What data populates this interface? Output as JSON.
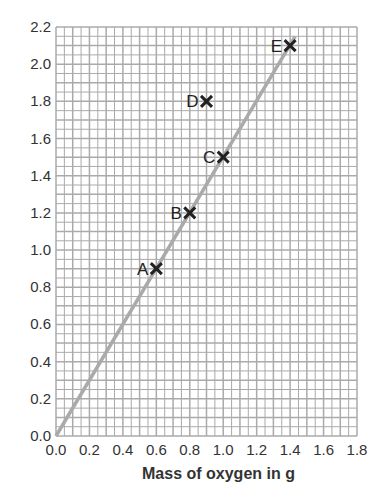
{
  "chart_data": {
    "type": "scatter",
    "title": "",
    "xlabel": "Mass of oxygen in g",
    "ylabel": "",
    "xlim": [
      0,
      1.8
    ],
    "ylim": [
      0,
      2.2
    ],
    "xticks": [
      "0.0",
      "0.2",
      "0.4",
      "0.6",
      "0.8",
      "1.0",
      "1.2",
      "1.4",
      "1.6",
      "1.8"
    ],
    "yticks": [
      "0.0",
      "0.2",
      "0.4",
      "0.6",
      "0.8",
      "1.0",
      "1.2",
      "1.4",
      "1.6",
      "1.8",
      "2.0",
      "2.2"
    ],
    "grid": true,
    "points": [
      {
        "label": "A",
        "x": 0.6,
        "y": 0.9
      },
      {
        "label": "B",
        "x": 0.8,
        "y": 1.2
      },
      {
        "label": "C",
        "x": 1.0,
        "y": 1.5
      },
      {
        "label": "D",
        "x": 0.9,
        "y": 1.8
      },
      {
        "label": "E",
        "x": 1.4,
        "y": 2.1
      }
    ],
    "best_fit_line": {
      "x0": 0,
      "y0": 0,
      "x1": 1.43,
      "y1": 2.15,
      "color": "#aaaaaa"
    }
  }
}
